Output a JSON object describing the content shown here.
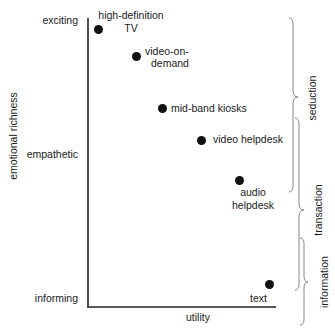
{
  "diagram": {
    "y_axis": {
      "title": "emotional richness",
      "levels": [
        "exciting",
        "empathetic",
        "informing"
      ]
    },
    "x_axis": {
      "title": "utility"
    },
    "points": [
      {
        "label_line1": "high-definition",
        "label_line2": "TV"
      },
      {
        "label_line1": "video-on-",
        "label_line2": "demand"
      },
      {
        "label": "mid-band kiosks"
      },
      {
        "label": "video helpdesk"
      },
      {
        "label_line1": "audio",
        "label_line2": "helpdesk"
      },
      {
        "label": "text"
      }
    ],
    "brackets": [
      "seduction",
      "transaction",
      "information"
    ]
  }
}
